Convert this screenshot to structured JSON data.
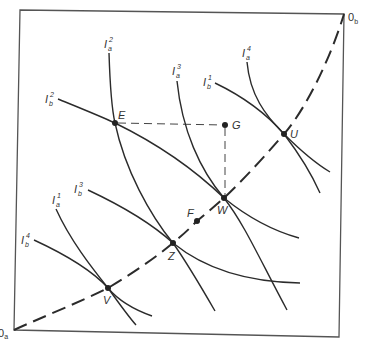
{
  "figure": {
    "type": "Edgeworth box",
    "colors": {
      "line": "#2b2b2b",
      "frame": "#555555",
      "label": "#333333",
      "background": "#ffffff"
    },
    "origins": {
      "a": {
        "base": "0",
        "sub": "a"
      },
      "b": {
        "base": "0",
        "sub": "b"
      }
    },
    "points": {
      "E": "E",
      "G": "G",
      "U": "U",
      "W": "W",
      "F": "F",
      "Z": "Z",
      "V": "V"
    },
    "indifference_curves": {
      "Ia1": {
        "base": "I",
        "sub": "a",
        "sup": "1"
      },
      "Ia2": {
        "base": "I",
        "sub": "a",
        "sup": "2"
      },
      "Ia3": {
        "base": "I",
        "sub": "a",
        "sup": "3"
      },
      "Ia4": {
        "base": "I",
        "sub": "a",
        "sup": "4"
      },
      "Ib1": {
        "base": "I",
        "sub": "b",
        "sup": "1"
      },
      "Ib2": {
        "base": "I",
        "sub": "b",
        "sup": "2"
      },
      "Ib3": {
        "base": "I",
        "sub": "b",
        "sup": "3"
      },
      "Ib4": {
        "base": "I",
        "sub": "b",
        "sup": "4"
      }
    },
    "contract_curve": {
      "style": "dashed",
      "from": "0_a",
      "to": "0_b",
      "through": [
        "V",
        "Z",
        "W",
        "U"
      ]
    },
    "guide_lines": {
      "style": "dashed",
      "segments": [
        "E-G",
        "G-W"
      ]
    }
  }
}
